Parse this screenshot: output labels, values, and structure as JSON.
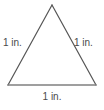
{
  "figure": {
    "shape": "equilateral-triangle",
    "background_color": "#ffffff",
    "stroke_color": "#555555",
    "base_stroke_color": "#808080",
    "label_color": "#4a4a4a",
    "labels": {
      "left_side": "1 in.",
      "right_side": "1 in.",
      "bottom_side": "1 in."
    },
    "geometry": {
      "apex": [
        52,
        5
      ],
      "bottom_left": [
        8,
        85
      ],
      "bottom_right": [
        96,
        85
      ]
    }
  }
}
